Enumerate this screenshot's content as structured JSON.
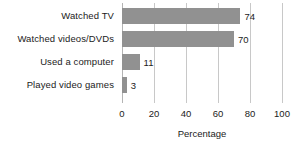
{
  "chart_data": {
    "type": "bar",
    "orientation": "horizontal",
    "title": "",
    "xlabel": "Percentage",
    "ylabel": "",
    "xlim": [
      0,
      100
    ],
    "xticks": [
      0,
      20,
      40,
      60,
      80,
      100
    ],
    "grid": true,
    "legend": false,
    "bar_color": "#919191",
    "gridline_color": "#c8c8c8",
    "categories": [
      "Watched TV",
      "Watched videos/DVDs",
      "Used a computer",
      "Played video games"
    ],
    "values": [
      74,
      70,
      11,
      3
    ],
    "value_labels": [
      "74",
      "70",
      "11",
      "3"
    ],
    "tick_labels": [
      "0",
      "20",
      "40",
      "60",
      "80",
      "100"
    ]
  }
}
